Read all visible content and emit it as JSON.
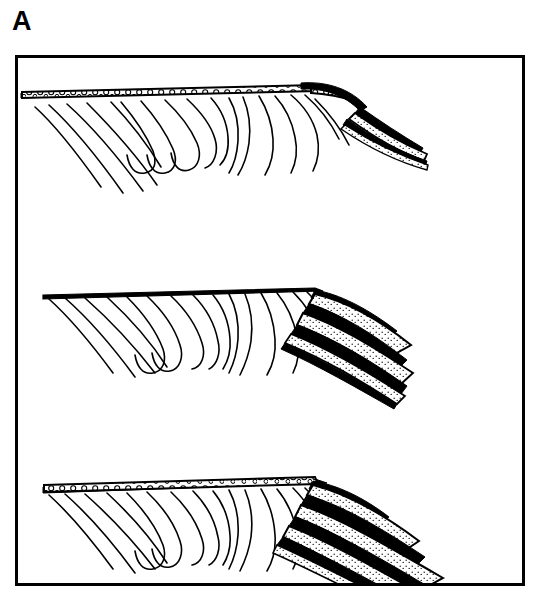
{
  "figure": {
    "panel_label": "A",
    "type": "geologic-cross-section-sequence",
    "background_color": "#ffffff",
    "line_color": "#000000",
    "frame": {
      "x": 15,
      "y": 55,
      "width": 510,
      "height": 531,
      "stroke_width": 3,
      "stroke_color": "#000000",
      "fill_color": "#ffffff"
    },
    "panel_count": 3,
    "panels": [
      {
        "index": 1,
        "name": "stage-1-capped-pediment",
        "description": "Pediment surface with continuous gravel cap over folded bedrock; fold crest at right with remnant lens and dissected downslope deposits.",
        "has_gravel_cap": true,
        "has_fan_wedge": true,
        "y_top": 75,
        "y_bottom": 185
      },
      {
        "index": 2,
        "name": "stage-2-stripped-surface",
        "description": "Gravel cap stripped by erosion leaving bare truncated folded bedrock; stippled alluvial deposits banked against the right slope.",
        "has_gravel_cap": false,
        "has_fan_wedge": true,
        "y_top": 285,
        "y_bottom": 370
      },
      {
        "index": 3,
        "name": "stage-3-renewed-aggradation",
        "description": "Renewed gravel cap across the pediment with a thick prograding alluvial fan wedge of stippled beds at right.",
        "has_gravel_cap": true,
        "has_fan_wedge": true,
        "y_top": 465,
        "y_bottom": 575
      }
    ],
    "units": [
      {
        "key": "gravel_cap",
        "label": "gravel cap",
        "pattern": "open-circles",
        "pattern_description": "thin band of small open circles (pebble conglomerate) between heavy dark bounding lines",
        "fill_color": "#ffffff",
        "outline_color": "#000000"
      },
      {
        "key": "alluvial_fan",
        "label": "alluvial fan deposits",
        "pattern": "fine-dot-stipple",
        "pattern_description": "fine dot stipple in inclined tabular bands separated by heavy dark lines",
        "fill_color": "#ffffff",
        "outline_color": "#000000"
      },
      {
        "key": "folded_bedrock",
        "label": "folded bedrock",
        "pattern": "line-traces",
        "pattern_description": "thin curved strata traces outlining tight anticlinal and synclinal hinges, truncated by the erosion surface",
        "fill_color": "#ffffff",
        "outline_color": "#000000"
      }
    ]
  }
}
